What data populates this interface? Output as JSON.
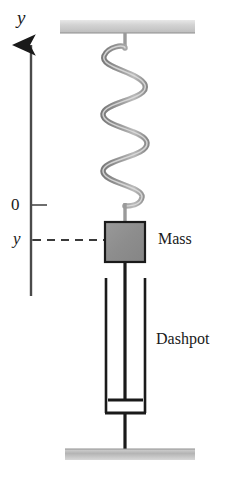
{
  "diagram": {
    "labels": {
      "axis_y": "y",
      "tick_zero": "0",
      "tick_y": "y",
      "mass": "Mass",
      "dashpot": "Dashpot"
    },
    "colors": {
      "line": "#1a1a1a",
      "spring": "#8a8a8a",
      "spring_highlight": "#c9c9c9",
      "mass_fill": "#8f8f8f",
      "mass_stroke": "#1a1a1a",
      "support_top": "#c4c4c4",
      "support_bottom": "#b0b0b0",
      "background": "#ffffff"
    },
    "geometry": {
      "axis_x": 31,
      "axis_top": 42,
      "axis_bottom": 296,
      "tick_zero_y": 205,
      "tick_y_y": 240,
      "mass_left": 105,
      "mass_top": 222,
      "mass_width": 40,
      "mass_height": 40,
      "spring_top": 36,
      "spring_bottom": 210,
      "spring_coils": 5,
      "cylinder_left": 105,
      "cylinder_right": 146,
      "cylinder_top": 278,
      "cylinder_bottom": 414,
      "piston_y": 400,
      "rod_x": 125,
      "support_top_y": 20,
      "support_bottom_y": 449
    }
  }
}
